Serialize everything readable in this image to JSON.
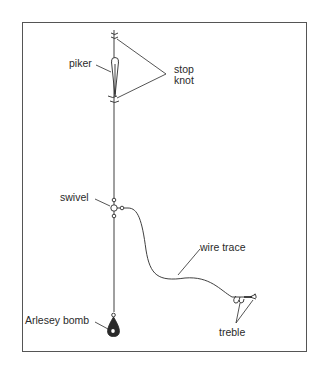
{
  "diagram": {
    "colors": {
      "line": "#2a2a2a",
      "frame": "#555555",
      "background": "#ffffff"
    },
    "labels": {
      "piker": "piker",
      "stop_knot_line1": "stop",
      "stop_knot_line2": "knot",
      "swivel": "swivel",
      "wire_trace": "wire trace",
      "treble": "treble",
      "arlesey_bomb": "Arlesey bomb"
    },
    "components": [
      {
        "name": "stop knot (upper)",
        "type": "knot"
      },
      {
        "name": "piker",
        "type": "float"
      },
      {
        "name": "stop knot (lower)",
        "type": "knot"
      },
      {
        "name": "swivel",
        "type": "three-way swivel"
      },
      {
        "name": "wire trace",
        "type": "trace"
      },
      {
        "name": "treble",
        "type": "hook"
      },
      {
        "name": "Arlesey bomb",
        "type": "weight"
      }
    ]
  }
}
